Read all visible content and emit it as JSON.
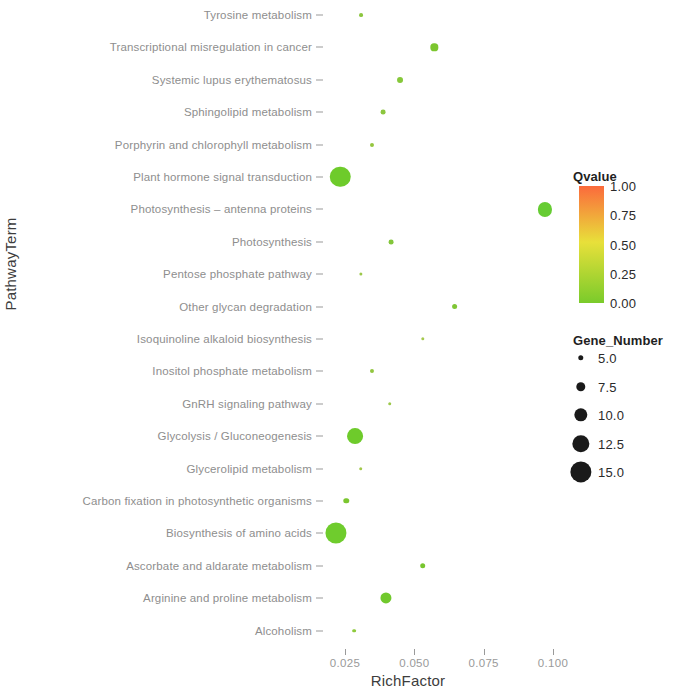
{
  "chart_data": {
    "type": "scatter",
    "title": "",
    "xlabel": "RichFactor",
    "ylabel": "PathwayTerm",
    "xlim": [
      0.018,
      0.108
    ],
    "xticks": [
      0.025,
      0.05,
      0.075,
      0.1
    ],
    "xticklabels": [
      "0.025",
      "0.050",
      "0.075",
      "0.100"
    ],
    "grid": false,
    "legend_position": "right",
    "size_legend": {
      "title": "Gene_Number",
      "values": [
        5.0,
        7.5,
        10.0,
        12.5,
        15.0
      ],
      "labels": [
        "5.0",
        "7.5",
        "10.0",
        "12.5",
        "15.0"
      ]
    },
    "color_legend": {
      "title": "Qvalue",
      "ticks": [
        1.0,
        0.75,
        0.5,
        0.25,
        0.0
      ],
      "ticklabels": [
        "1.00",
        "0.75",
        "0.50",
        "0.25",
        "0.00"
      ],
      "colormap_low": "#7ACB2B",
      "colormap_mid": "#E8E03A",
      "colormap_high": "#FB6A3C"
    },
    "categories": [
      "Tyrosine metabolism",
      "Transcriptional misregulation in cancer",
      "Systemic lupus erythematosus",
      "Sphingolipid metabolism",
      "Porphyrin and chlorophyll metabolism",
      "Plant hormone signal transduction",
      "Photosynthesis – antenna proteins",
      "Photosynthesis",
      "Pentose phosphate pathway",
      "Other glycan degradation",
      "Isoquinoline alkaloid biosynthesis",
      "Inositol phosphate metabolism",
      "GnRH signaling pathway",
      "Glycolysis / Gluconeogenesis",
      "Glycerolipid metabolism",
      "Carbon fixation in photosynthetic organisms",
      "Biosynthesis of amino acids",
      "Ascorbate and aldarate metabolism",
      "Arginine and proline metabolism",
      "Alcoholism"
    ],
    "points": [
      {
        "category": "Tyrosine metabolism",
        "richfactor": 0.0308,
        "gene_number": 4.0,
        "qvalue": 0.12,
        "color": "#8CC63F"
      },
      {
        "category": "Transcriptional misregulation in cancer",
        "richfactor": 0.0572,
        "gene_number": 6.2,
        "qvalue": 0.1,
        "color": "#7CC62F"
      },
      {
        "category": "Systemic lupus erythematosus",
        "richfactor": 0.0449,
        "gene_number": 5.3,
        "qvalue": 0.11,
        "color": "#86C83A"
      },
      {
        "category": "Sphingolipid metabolism",
        "richfactor": 0.0388,
        "gene_number": 4.6,
        "qvalue": 0.11,
        "color": "#8CC63F"
      },
      {
        "category": "Porphyrin and chlorophyll metabolism",
        "richfactor": 0.0348,
        "gene_number": 4.1,
        "qvalue": 0.13,
        "color": "#95C63F"
      },
      {
        "category": "Plant hormone signal transduction",
        "richfactor": 0.0233,
        "gene_number": 14.5,
        "qvalue": 0.03,
        "color": "#6ECB2B"
      },
      {
        "category": "Photosynthesis – antenna proteins",
        "richfactor": 0.0972,
        "gene_number": 10.5,
        "qvalue": 0.02,
        "color": "#66CC33"
      },
      {
        "category": "Photosynthesis",
        "richfactor": 0.0415,
        "gene_number": 4.6,
        "qvalue": 0.1,
        "color": "#83C63B"
      },
      {
        "category": "Pentose phosphate pathway",
        "richfactor": 0.0307,
        "gene_number": 3.6,
        "qvalue": 0.14,
        "color": "#9CC84A"
      },
      {
        "category": "Other glycan degradation",
        "richfactor": 0.0645,
        "gene_number": 5.2,
        "qvalue": 0.09,
        "color": "#7FC635"
      },
      {
        "category": "Isoquinoline alkaloid biosynthesis",
        "richfactor": 0.053,
        "gene_number": 3.7,
        "qvalue": 0.15,
        "color": "#A5C94F"
      },
      {
        "category": "Inositol phosphate metabolism",
        "richfactor": 0.0346,
        "gene_number": 4.1,
        "qvalue": 0.13,
        "color": "#92C63F"
      },
      {
        "category": "GnRH signaling pathway",
        "richfactor": 0.0411,
        "gene_number": 3.8,
        "qvalue": 0.14,
        "color": "#9CC84A"
      },
      {
        "category": "Glycolysis / Gluconeogenesis",
        "richfactor": 0.0287,
        "gene_number": 11.6,
        "qvalue": 0.03,
        "color": "#6ECB2B"
      },
      {
        "category": "Glycerolipid metabolism",
        "richfactor": 0.0307,
        "gene_number": 3.8,
        "qvalue": 0.15,
        "color": "#A2C84A"
      },
      {
        "category": "Carbon fixation in photosynthetic organisms",
        "richfactor": 0.0254,
        "gene_number": 5.0,
        "qvalue": 0.09,
        "color": "#7BC62F"
      },
      {
        "category": "Biosynthesis of amino acids",
        "richfactor": 0.0218,
        "gene_number": 14.9,
        "qvalue": 0.02,
        "color": "#6FCC2D"
      },
      {
        "category": "Ascorbate and aldarate metabolism",
        "richfactor": 0.053,
        "gene_number": 5.1,
        "qvalue": 0.08,
        "color": "#78C52E"
      },
      {
        "category": "Arginine and proline metabolism",
        "richfactor": 0.0398,
        "gene_number": 8.6,
        "qvalue": 0.05,
        "color": "#71C92D"
      },
      {
        "category": "Alcoholism",
        "richfactor": 0.0282,
        "gene_number": 3.9,
        "qvalue": 0.12,
        "color": "#8ECA3C"
      }
    ]
  }
}
